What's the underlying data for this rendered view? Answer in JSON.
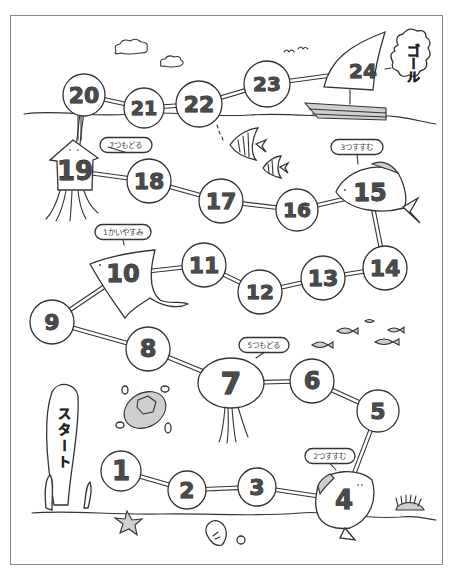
{
  "board": {
    "title": "すごろく",
    "start_label": "スタート",
    "goal_label": "ゴール",
    "colors": {
      "line": "#333333",
      "numeral_fill": "#4a4a4a",
      "accent_gray": "#cfcfcf",
      "frame": "#8a8a8a"
    },
    "squares": [
      {
        "n": "1",
        "x": 121,
        "y": 471,
        "r": 20,
        "fs": 26,
        "shape": "circle"
      },
      {
        "n": "2",
        "x": 187,
        "y": 490,
        "r": 19,
        "fs": 22,
        "shape": "circle"
      },
      {
        "n": "3",
        "x": 257,
        "y": 487,
        "r": 19,
        "fs": 22,
        "shape": "circle"
      },
      {
        "n": "4",
        "x": 344,
        "y": 500,
        "r": 24,
        "fs": 26,
        "shape": "flounder"
      },
      {
        "n": "5",
        "x": 378,
        "y": 411,
        "r": 21,
        "fs": 22,
        "shape": "circle"
      },
      {
        "n": "6",
        "x": 312,
        "y": 381,
        "r": 22,
        "fs": 24,
        "shape": "circle"
      },
      {
        "n": "7",
        "x": 231,
        "y": 383,
        "r": 31,
        "fs": 30,
        "shape": "jellyfish"
      },
      {
        "n": "8",
        "x": 148,
        "y": 349,
        "r": 22,
        "fs": 24,
        "shape": "circle"
      },
      {
        "n": "9",
        "x": 52,
        "y": 322,
        "r": 22,
        "fs": 22,
        "shape": "circle"
      },
      {
        "n": "10",
        "x": 123,
        "y": 274,
        "r": 28,
        "fs": 24,
        "shape": "stingray"
      },
      {
        "n": "11",
        "x": 204,
        "y": 265,
        "r": 22,
        "fs": 22,
        "shape": "circle"
      },
      {
        "n": "12",
        "x": 260,
        "y": 292,
        "r": 22,
        "fs": 20,
        "shape": "circle"
      },
      {
        "n": "13",
        "x": 323,
        "y": 278,
        "r": 22,
        "fs": 22,
        "shape": "circle"
      },
      {
        "n": "14",
        "x": 385,
        "y": 268,
        "r": 22,
        "fs": 22,
        "shape": "circle"
      },
      {
        "n": "15",
        "x": 370,
        "y": 193,
        "r": 28,
        "fs": 24,
        "shape": "fish"
      },
      {
        "n": "16",
        "x": 297,
        "y": 210,
        "r": 21,
        "fs": 20,
        "shape": "circle"
      },
      {
        "n": "17",
        "x": 221,
        "y": 201,
        "r": 22,
        "fs": 22,
        "shape": "circle"
      },
      {
        "n": "18",
        "x": 149,
        "y": 181,
        "r": 22,
        "fs": 22,
        "shape": "circle"
      },
      {
        "n": "19",
        "x": 75,
        "y": 171,
        "r": 25,
        "fs": 26,
        "shape": "squid"
      },
      {
        "n": "20",
        "x": 84,
        "y": 95,
        "r": 21,
        "fs": 22,
        "shape": "circle"
      },
      {
        "n": "21",
        "x": 144,
        "y": 108,
        "r": 20,
        "fs": 19,
        "shape": "circle"
      },
      {
        "n": "22",
        "x": 199,
        "y": 104,
        "r": 23,
        "fs": 22,
        "shape": "circle"
      },
      {
        "n": "23",
        "x": 267,
        "y": 84,
        "r": 23,
        "fs": 20,
        "shape": "circle"
      },
      {
        "n": "24",
        "x": 363,
        "y": 71,
        "r": 0,
        "fs": 20,
        "shape": "sail"
      }
    ],
    "bubbles": [
      {
        "text": "7つもどる",
        "x": 126,
        "y": 145,
        "w": 52,
        "h": 15,
        "tail_x": 108,
        "tail_y": 147
      },
      {
        "text": "3つすすむ",
        "x": 357,
        "y": 147,
        "w": 52,
        "h": 15,
        "tail_x": 358,
        "tail_y": 164
      },
      {
        "text": "1かいやすみ",
        "x": 123,
        "y": 232,
        "w": 56,
        "h": 15,
        "tail_x": 124,
        "tail_y": 245
      },
      {
        "text": "5つもどる",
        "x": 264,
        "y": 345,
        "w": 50,
        "h": 15,
        "tail_x": 256,
        "tail_y": 358
      },
      {
        "text": "2つすすむ",
        "x": 330,
        "y": 456,
        "w": 50,
        "h": 15,
        "tail_x": 336,
        "tail_y": 470
      }
    ]
  }
}
